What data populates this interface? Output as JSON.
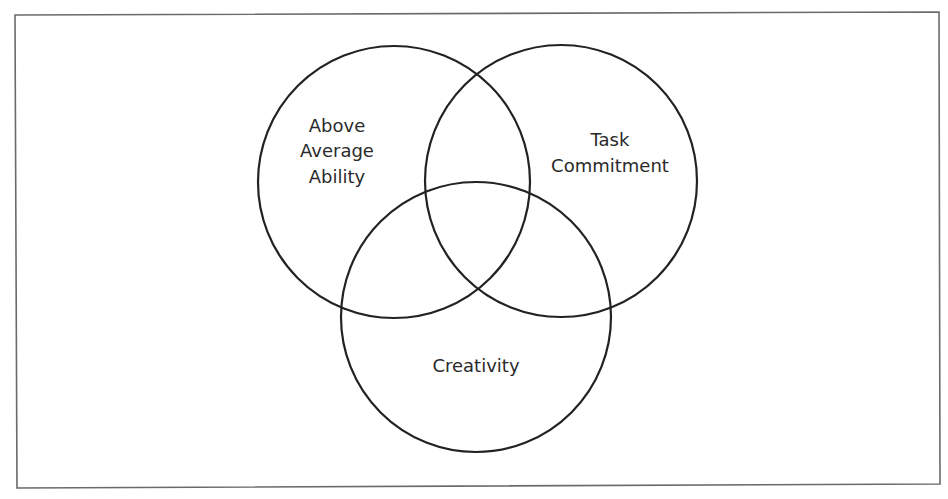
{
  "diagram": {
    "type": "venn",
    "frame": {
      "x": 16,
      "y": 14,
      "width": 924,
      "height": 472,
      "stroke": "#6a6a6a"
    },
    "stroke_color": "#222222",
    "circles": [
      {
        "id": "above-average-ability",
        "cx": 394,
        "cy": 182,
        "r": 136,
        "label_lines": [
          "Above",
          "Average",
          "Ability"
        ],
        "label_x": 337,
        "label_y": [
          132,
          157,
          183
        ]
      },
      {
        "id": "task-commitment",
        "cx": 561,
        "cy": 181,
        "r": 136,
        "label_lines": [
          "Task",
          "Commitment"
        ],
        "label_x": 610,
        "label_y": [
          146,
          172
        ]
      },
      {
        "id": "creativity",
        "cx": 476,
        "cy": 317,
        "r": 135,
        "label_lines": [
          "Creativity"
        ],
        "label_x": 476,
        "label_y": [
          372
        ]
      }
    ]
  },
  "labels": {
    "ability": {
      "line1": "Above",
      "line2": "Average",
      "line3": "Ability"
    },
    "task": {
      "line1": "Task",
      "line2": "Commitment"
    },
    "creativity": {
      "line1": "Creativity"
    }
  }
}
